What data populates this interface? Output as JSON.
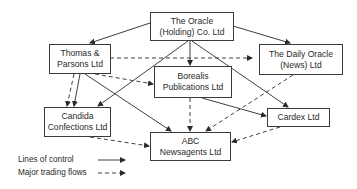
{
  "diagram": {
    "nodes": [
      {
        "id": "oracle_holding",
        "lines": [
          "The Oracle",
          "(Holding) Co. Ltd"
        ]
      },
      {
        "id": "thomas_parsons",
        "lines": [
          "Thomas &",
          "Parsons Ltd"
        ]
      },
      {
        "id": "daily_oracle",
        "lines": [
          "The Daily Oracle",
          "(News) Ltd"
        ]
      },
      {
        "id": "borealis",
        "lines": [
          "Borealis",
          "Publications Ltd"
        ]
      },
      {
        "id": "candida",
        "lines": [
          "Candida",
          "Confections Ltd"
        ]
      },
      {
        "id": "abc",
        "lines": [
          "ABC",
          "Newsagents Ltd"
        ]
      },
      {
        "id": "cardex",
        "lines": [
          "Cardex Ltd"
        ]
      }
    ],
    "lines_of_control": [
      {
        "from": "oracle_holding",
        "to": "thomas_parsons"
      },
      {
        "from": "oracle_holding",
        "to": "daily_oracle"
      },
      {
        "from": "oracle_holding",
        "to": "borealis"
      },
      {
        "from": "oracle_holding",
        "to": "candida"
      },
      {
        "from": "oracle_holding",
        "to": "cardex"
      },
      {
        "from": "thomas_parsons",
        "to": "candida"
      },
      {
        "from": "thomas_parsons",
        "to": "abc"
      },
      {
        "from": "borealis",
        "to": "cardex"
      }
    ],
    "trading_flows": [
      {
        "from": "thomas_parsons",
        "to": "daily_oracle"
      },
      {
        "from": "thomas_parsons",
        "to": "borealis"
      },
      {
        "from": "thomas_parsons",
        "to": "candida"
      },
      {
        "from": "borealis",
        "to": "abc"
      },
      {
        "from": "daily_oracle",
        "to": "abc"
      },
      {
        "from": "candida",
        "to": "abc"
      },
      {
        "from": "cardex",
        "to": "abc"
      }
    ]
  },
  "legend": {
    "control_label": "Lines of control",
    "trading_label": "Major trading flows"
  }
}
